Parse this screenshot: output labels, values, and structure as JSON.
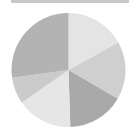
{
  "chart_data": {
    "type": "pie",
    "title": "",
    "legend": "none",
    "start_angle_deg": 0,
    "direction": "clockwise",
    "slices": [
      {
        "label": "",
        "value": 17.0,
        "color": "#e4e4e4"
      },
      {
        "label": "",
        "value": 16.4,
        "color": "#cfcfcf"
      },
      {
        "label": "",
        "value": 16.1,
        "color": "#a9a9a9"
      },
      {
        "label": "",
        "value": 15.8,
        "color": "#e6e6e6"
      },
      {
        "label": "",
        "value": 7.5,
        "color": "#cbcbcb"
      },
      {
        "label": "",
        "value": 27.2,
        "color": "#b3b3b3"
      }
    ],
    "values": [
      17.0,
      16.4,
      16.1,
      15.8,
      7.5,
      27.2
    ]
  },
  "top_bar": {
    "color": "#c8c8c8"
  }
}
